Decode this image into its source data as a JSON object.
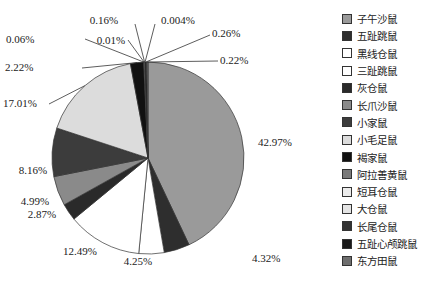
{
  "chart_data": {
    "type": "pie",
    "title": "",
    "start_angle": "top, clockwise",
    "categories": [
      "子午沙鼠",
      "五趾跳鼠",
      "黑线仓鼠",
      "三趾跳鼠",
      "灰仓鼠",
      "长爪沙鼠",
      "小家鼠",
      "小毛足鼠",
      "褐家鼠",
      "阿拉善黄鼠",
      "短耳仓鼠",
      "大仓鼠",
      "长尾仓鼠",
      "五趾心颅跳鼠",
      "东方田鼠"
    ],
    "values": [
      42.97,
      4.32,
      4.25,
      12.49,
      2.87,
      4.99,
      8.16,
      17.01,
      2.22,
      0.06,
      0.01,
      0.16,
      0.004,
      0.26,
      0.22
    ],
    "labels": [
      "42.97%",
      "4.32%",
      "4.25%",
      "12.49%",
      "2.87%",
      "4.99%",
      "8.16%",
      "17.01%",
      "2.22%",
      "0.06%",
      "0.01%",
      "0.16%",
      "0.004%",
      "0.26%",
      "0.22%"
    ],
    "colors": [
      "#9a9a9a",
      "#2e2e2e",
      "#ffffff",
      "#ffffff",
      "#2a2a2a",
      "#8a8a8a",
      "#3c3c3c",
      "#dcdcdc",
      "#111111",
      "#7a7a7a",
      "#ececec",
      "#e4e4e4",
      "#333333",
      "#1a1a1a",
      "#6e6e6e"
    ],
    "legend_position": "right"
  },
  "legend": {
    "items": [
      {
        "label": "子午沙鼠",
        "color": "#9a9a9a"
      },
      {
        "label": "五趾跳鼠",
        "color": "#2e2e2e"
      },
      {
        "label": "黑线仓鼠",
        "color": "#ffffff"
      },
      {
        "label": "三趾跳鼠",
        "color": "#ffffff"
      },
      {
        "label": "灰仓鼠",
        "color": "#2a2a2a"
      },
      {
        "label": "长爪沙鼠",
        "color": "#8a8a8a"
      },
      {
        "label": "小家鼠",
        "color": "#3c3c3c"
      },
      {
        "label": "小毛足鼠",
        "color": "#dcdcdc"
      },
      {
        "label": "褐家鼠",
        "color": "#111111"
      },
      {
        "label": "阿拉善黄鼠",
        "color": "#7a7a7a"
      },
      {
        "label": "短耳仓鼠",
        "color": "#ececec"
      },
      {
        "label": "大仓鼠",
        "color": "#e4e4e4"
      },
      {
        "label": "长尾仓鼠",
        "color": "#333333"
      },
      {
        "label": "五趾心颅跳鼠",
        "color": "#1a1a1a"
      },
      {
        "label": "东方田鼠",
        "color": "#6e6e6e"
      }
    ]
  }
}
